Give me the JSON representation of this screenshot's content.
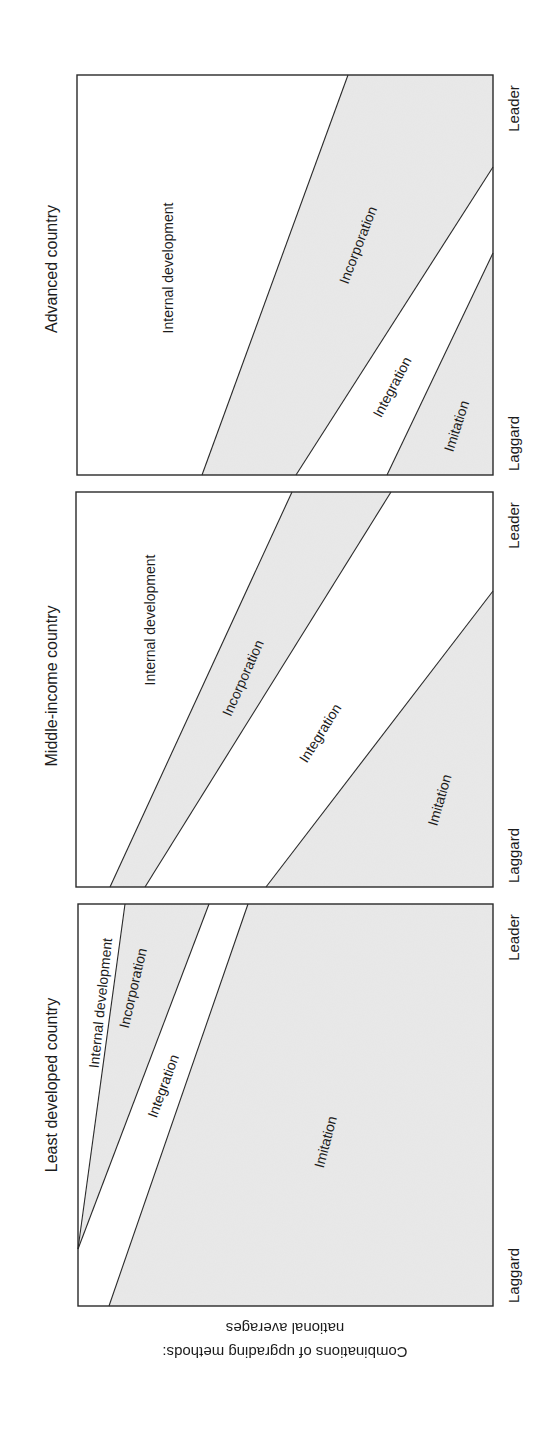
{
  "figure": {
    "orientation": "rotated 90deg clockwise on page",
    "axis_caption": {
      "line1": "Combinations of upgrading methods:",
      "line2": "national averages"
    },
    "colors": {
      "shaded": "#e6e6e6",
      "unshaded": "#ffffff",
      "stroke": "#2a2a2a"
    },
    "axis_labels": {
      "low": "Laggard",
      "high": "Leader"
    }
  },
  "chart_data": {
    "type": "area",
    "title": "Combinations of upgrading methods: national averages",
    "xlabel": "Firm position (Laggard → Leader)",
    "ylabel": "Share of upgrading method (stacked, 0–100%)",
    "x_ticks": [
      "Laggard",
      "Leader"
    ],
    "series_order_bottom_to_top": [
      "Imitation",
      "Integration",
      "Incorporation",
      "Internal development"
    ],
    "panels": [
      {
        "name": "Least developed country",
        "boundaries_pct": {
          "Imitation_top": {
            "Laggard": 92,
            "Leader": 63
          },
          "Integration_top": {
            "Laggard": 100,
            "Leader": 73
          },
          "Incorporation_top": {
            "Laggard": 100,
            "Leader": 88
          }
        },
        "labels": [
          "Internal development",
          "Incorporation",
          "Integration",
          "Imitation"
        ]
      },
      {
        "name": "Middle-income country",
        "boundaries_pct": {
          "Imitation_top": {
            "Laggard": 46,
            "Leader": 0
          },
          "Integration_top": {
            "Laggard": 83,
            "Leader": 25
          },
          "Incorporation_top": {
            "Laggard": 92,
            "Leader": 48
          }
        },
        "labels": [
          "Internal development",
          "Incorporation",
          "Integration",
          "Imitation"
        ]
      },
      {
        "name": "Advanced country",
        "boundaries_pct": {
          "Imitation_top": {
            "Laggard": 25,
            "Leader": 0
          },
          "Integration_top": {
            "Laggard": 47,
            "Leader": 0
          },
          "Incorporation_top": {
            "Laggard": 70,
            "Leader": 35
          }
        },
        "labels": [
          "Internal development",
          "Incorporation",
          "Integration",
          "Imitation"
        ]
      }
    ]
  },
  "panels": [
    {
      "title": "Advanced country",
      "box": {
        "left": 77,
        "top": 75,
        "right": 493,
        "bottom": 475
      },
      "regions": [
        {
          "name": "imitation",
          "shade": true,
          "points": [
            [
              387,
              475
            ],
            [
              493,
              253
            ],
            [
              493,
              475
            ]
          ]
        },
        {
          "name": "integration",
          "shade": false,
          "points": [
            [
              296,
              475
            ],
            [
              493,
              167
            ],
            [
              493,
              253
            ],
            [
              387,
              475
            ]
          ]
        },
        {
          "name": "incorporation",
          "shade": true,
          "points": [
            [
              202,
              475
            ],
            [
              348,
              75
            ],
            [
              493,
              75
            ],
            [
              493,
              167
            ],
            [
              296,
              475
            ]
          ]
        }
      ],
      "lines": [
        [
          [
            202,
            475
          ],
          [
            348,
            75
          ]
        ],
        [
          [
            296,
            475
          ],
          [
            493,
            167
          ]
        ],
        [
          [
            387,
            475
          ],
          [
            493,
            253
          ]
        ]
      ],
      "labels": {
        "internal": {
          "text": "Internal development",
          "x": 168,
          "y": 268,
          "angle": -90
        },
        "incorporation": {
          "text": "Incorporation",
          "x": 358,
          "y": 245,
          "angle": -69
        },
        "integration": {
          "text": "Integration",
          "x": 392,
          "y": 387,
          "angle": -62
        },
        "imitation": {
          "text": "Imitation",
          "x": 456,
          "y": 426,
          "angle": -72
        }
      },
      "title_pos": {
        "x": 52,
        "y": 269
      },
      "leader_pos": {
        "x": 513,
        "y": 108
      },
      "laggard_pos": {
        "x": 513,
        "y": 443
      }
    },
    {
      "title": "Middle-income country",
      "box": {
        "left": 76,
        "top": 492,
        "right": 493,
        "bottom": 887
      },
      "regions": [
        {
          "name": "imitation",
          "shade": true,
          "points": [
            [
              266,
              887
            ],
            [
              493,
              591
            ],
            [
              493,
              887
            ]
          ]
        },
        {
          "name": "integration",
          "shade": false,
          "points": [
            [
              145,
              887
            ],
            [
              391,
              492
            ],
            [
              493,
              492
            ],
            [
              493,
              591
            ],
            [
              266,
              887
            ]
          ]
        },
        {
          "name": "incorporation",
          "shade": true,
          "points": [
            [
              110,
              887
            ],
            [
              292,
              492
            ],
            [
              391,
              492
            ],
            [
              145,
              887
            ]
          ]
        }
      ],
      "lines": [
        [
          [
            110,
            887
          ],
          [
            292,
            492
          ]
        ],
        [
          [
            145,
            887
          ],
          [
            391,
            492
          ]
        ],
        [
          [
            266,
            887
          ],
          [
            493,
            591
          ]
        ]
      ],
      "labels": {
        "internal": {
          "text": "Internal development",
          "x": 150,
          "y": 620,
          "angle": -90
        },
        "incorporation": {
          "text": "Incorporation",
          "x": 243,
          "y": 678,
          "angle": -66
        },
        "integration": {
          "text": "Integration",
          "x": 320,
          "y": 733,
          "angle": -58
        },
        "imitation": {
          "text": "Imitation",
          "x": 439,
          "y": 800,
          "angle": -74
        }
      },
      "title_pos": {
        "x": 52,
        "y": 686
      },
      "leader_pos": {
        "x": 513,
        "y": 525
      },
      "laggard_pos": {
        "x": 513,
        "y": 855
      }
    },
    {
      "title": "Least developed country",
      "box": {
        "left": 78,
        "top": 904,
        "right": 493,
        "bottom": 1306
      },
      "regions": [
        {
          "name": "imitation",
          "shade": true,
          "points": [
            [
              109,
              1306
            ],
            [
              248,
              904
            ],
            [
              493,
              904
            ],
            [
              493,
              1306
            ]
          ]
        },
        {
          "name": "integration",
          "shade": false,
          "points": [
            [
              78,
              1249
            ],
            [
              209,
              904
            ],
            [
              248,
              904
            ],
            [
              109,
              1306
            ],
            [
              78,
              1306
            ]
          ]
        },
        {
          "name": "incorporation",
          "shade": true,
          "points": [
            [
              78,
              1249
            ],
            [
              125,
              904
            ],
            [
              209,
              904
            ]
          ]
        }
      ],
      "lines": [
        [
          [
            78,
            1249
          ],
          [
            125,
            904
          ]
        ],
        [
          [
            78,
            1249
          ],
          [
            209,
            904
          ]
        ],
        [
          [
            109,
            1306
          ],
          [
            248,
            904
          ]
        ]
      ],
      "labels": {
        "internal": {
          "text": "Internal development",
          "x": 100,
          "y": 1003,
          "angle": -84
        },
        "incorporation": {
          "text": "Incorporation",
          "x": 133,
          "y": 988,
          "angle": -77
        },
        "integration": {
          "text": "Integration",
          "x": 163,
          "y": 1086,
          "angle": -70
        },
        "imitation": {
          "text": "Imitation",
          "x": 325,
          "y": 1142,
          "angle": -75
        }
      },
      "title_pos": {
        "x": 52,
        "y": 1085
      },
      "leader_pos": {
        "x": 513,
        "y": 937
      },
      "laggard_pos": {
        "x": 513,
        "y": 1275
      }
    }
  ]
}
